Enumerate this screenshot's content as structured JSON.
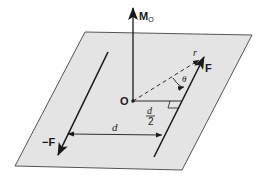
{
  "diagram": {
    "type": "couple-moment-diagram",
    "colors": {
      "plane_fill": "#e4e4e4",
      "plane_edge": "#555555",
      "line": "#1a1a1a",
      "background": "#ffffff"
    },
    "labels": {
      "moment": "M",
      "moment_sub": "O",
      "origin": "O",
      "force": "F",
      "neg_force": "−F",
      "position_vector": "r",
      "angle": "θ",
      "half_distance_num": "d",
      "half_distance_den": "2",
      "distance": "d"
    }
  }
}
